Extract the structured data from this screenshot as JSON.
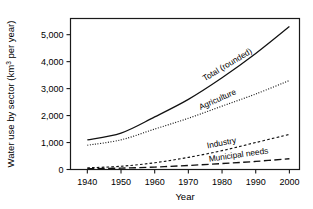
{
  "chart_data": {
    "type": "line",
    "title": "",
    "xlabel": "Year",
    "ylabel": "Water use by sector (km3 per year)",
    "ylabel_main": "Water use by sector (km",
    "ylabel_sup": "3",
    "ylabel_tail": " per year)",
    "x": [
      1940,
      1950,
      1960,
      1970,
      1980,
      1990,
      2000
    ],
    "xlim": [
      1935,
      2003
    ],
    "ylim": [
      0,
      5600
    ],
    "grid": false,
    "legend_position": "inline-curve-labels",
    "xticks": [
      1940,
      1950,
      1960,
      1970,
      1980,
      1990,
      2000
    ],
    "xtick_labels": [
      "1940",
      "1950",
      "1960",
      "1970",
      "1980",
      "1990",
      "2000"
    ],
    "yticks": [
      0,
      1000,
      2000,
      3000,
      4000,
      5000
    ],
    "ytick_labels": [
      "0",
      "1,000",
      "2,000",
      "3,000",
      "4,000",
      "5,000"
    ],
    "series": [
      {
        "name": "Total (rounded)",
        "style": "solid",
        "label_angle": -31,
        "values": [
          1100,
          1350,
          1950,
          2600,
          3400,
          4300,
          5300
        ]
      },
      {
        "name": "Agriculture",
        "style": "dotted",
        "label_angle": -24,
        "values": [
          900,
          1100,
          1500,
          1900,
          2350,
          2800,
          3300
        ]
      },
      {
        "name": "Industry",
        "style": "dashed-fine",
        "label_angle": -11,
        "values": [
          60,
          120,
          250,
          450,
          700,
          1000,
          1300
        ]
      },
      {
        "name": "Municipal needs",
        "style": "dashed-long",
        "label_angle": -8,
        "values": [
          30,
          50,
          90,
          150,
          220,
          300,
          400
        ]
      }
    ]
  }
}
